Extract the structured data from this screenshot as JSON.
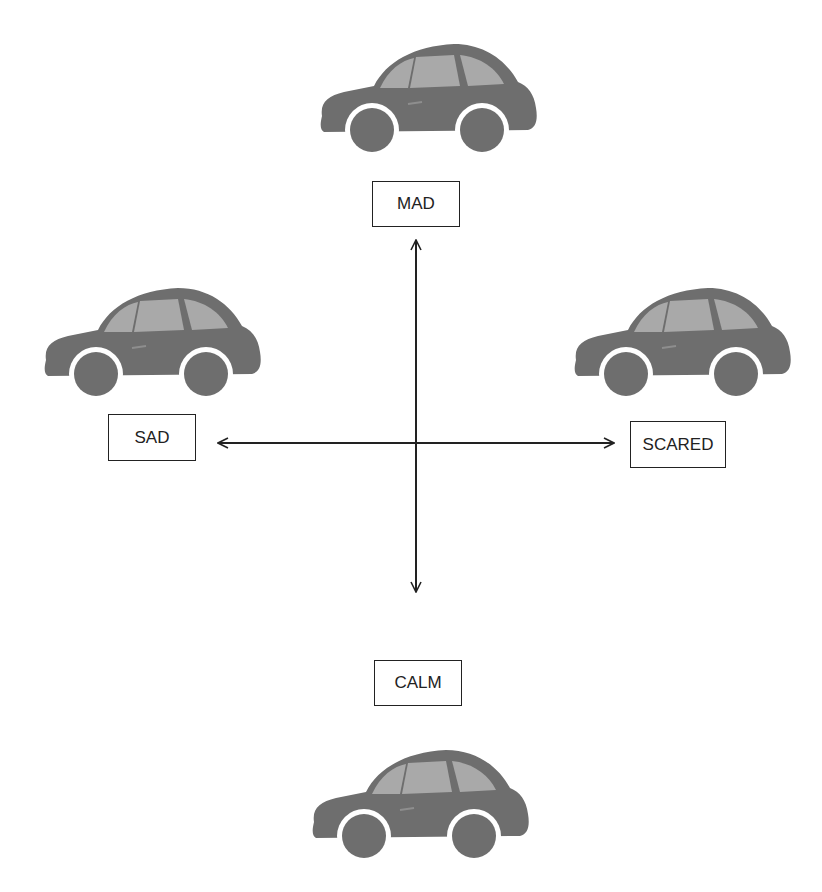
{
  "diagram": {
    "type": "emotion-axes",
    "colors": {
      "car_body": "#6e6e6e",
      "car_window": "#a9a9a9",
      "line": "#222222"
    },
    "labels": {
      "top": "MAD",
      "left": "SAD",
      "right": "SCARED",
      "bottom": "CALM"
    },
    "icons": {
      "top": "car-icon",
      "left": "car-icon",
      "right": "car-icon",
      "bottom": "car-icon"
    }
  }
}
